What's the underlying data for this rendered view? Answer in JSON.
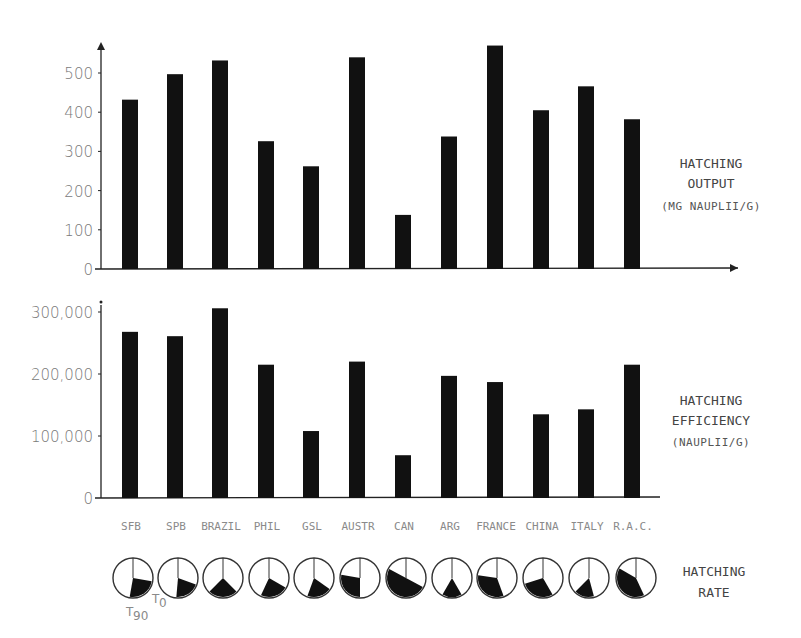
{
  "chart_data": [
    {
      "type": "bar",
      "title": "Hatching Output",
      "ylabel": "HATCHING OUTPUT (MG NAUPLII/G)",
      "ylabel_lines": [
        "HATCHING",
        "OUTPUT",
        "(MG NAUPLII/G)"
      ],
      "xlabel": "",
      "categories": [
        "SFB",
        "SPB",
        "BRAZIL",
        "PHIL",
        "GSL",
        "AUSTR",
        "CAN",
        "ARG",
        "FRANCE",
        "CHINA",
        "ITALY",
        "R.A.C."
      ],
      "values": [
        432,
        497,
        532,
        326,
        262,
        540,
        138,
        338,
        570,
        405,
        466,
        382
      ],
      "yticks": [
        0,
        100,
        200,
        300,
        400,
        500
      ],
      "ytick_labels": [
        "0",
        "100",
        "200",
        "300",
        "400",
        "500"
      ],
      "ylim": [
        0,
        600
      ],
      "grid": false,
      "bar_color": "#111111"
    },
    {
      "type": "bar",
      "title": "Hatching Efficiency",
      "ylabel": "HATCHING EFFICIENCY (NAUPLII/G)",
      "ylabel_lines": [
        "HATCHING",
        "EFFICIENCY",
        "(NAUPLII/G)"
      ],
      "xlabel": "",
      "categories": [
        "SFB",
        "SPB",
        "BRAZIL",
        "PHIL",
        "GSL",
        "AUSTR",
        "CAN",
        "ARG",
        "FRANCE",
        "CHINA",
        "ITALY",
        "R.A.C."
      ],
      "values": [
        268000,
        261000,
        306000,
        215000,
        108000,
        220000,
        69000,
        197000,
        187000,
        135000,
        143000,
        215000
      ],
      "yticks": [
        0,
        100000,
        200000,
        300000
      ],
      "ytick_labels": [
        "0",
        "100,000",
        "200,000",
        "300,000"
      ],
      "ylim": [
        0,
        310000
      ],
      "grid": false,
      "bar_color": "#111111"
    },
    {
      "type": "pie",
      "title": "Hatching Rate",
      "ylabel_lines": [
        "HATCHING",
        "RATE"
      ],
      "categories": [
        "SFB",
        "SPB",
        "BRAZIL",
        "PHIL",
        "GSL",
        "AUSTR",
        "CAN",
        "ARG",
        "FRANCE",
        "CHINA",
        "ITALY",
        "R.A.C."
      ],
      "filled_sector_degrees": [
        {
          "start": 100,
          "end": 190
        },
        {
          "start": 110,
          "end": 185
        },
        {
          "start": 135,
          "end": 225
        },
        {
          "start": 120,
          "end": 205
        },
        {
          "start": 125,
          "end": 200
        },
        {
          "start": 180,
          "end": 280
        },
        {
          "start": 118,
          "end": 298
        },
        {
          "start": 150,
          "end": 210
        },
        {
          "start": 160,
          "end": 278
        },
        {
          "start": 150,
          "end": 252
        },
        {
          "start": 165,
          "end": 225
        },
        {
          "start": 155,
          "end": 300
        }
      ],
      "annotations": [
        "T0",
        "T90"
      ]
    }
  ],
  "labels": {
    "output_title": [
      "HATCHING",
      "OUTPUT",
      "(MG NAUPLII/G)"
    ],
    "efficiency_title": [
      "HATCHING",
      "EFFICIENCY",
      "(NAUPLII/G)"
    ],
    "rate_title": [
      "HATCHING",
      "RATE"
    ],
    "t0": "T",
    "t0_sub": "0",
    "t90": "T",
    "t90_sub": "90"
  }
}
